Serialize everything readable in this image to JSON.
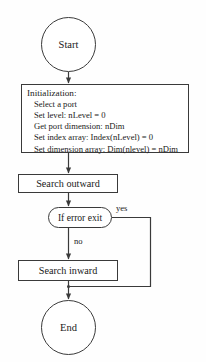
{
  "diagram": {
    "stroke_color": "#3a3a3a",
    "background_color": "#ffffff"
  },
  "nodes": {
    "start": {
      "label": "Start",
      "shape": "circle"
    },
    "initialization": {
      "shape": "process",
      "title": "Initialization:",
      "steps": [
        "Select a port",
        "Set level:  nLevel = 0",
        "Get port dimension:  nDim",
        "Set index array: Index(nLevel) = 0",
        "Set dimension array: Dim(nlevel) = nDim"
      ]
    },
    "search_outward": {
      "label": "Search outward",
      "shape": "process"
    },
    "decision": {
      "label": "If error exit",
      "shape": "decision"
    },
    "search_inward": {
      "label": "Search inward",
      "shape": "process"
    },
    "end": {
      "label": "End",
      "shape": "circle"
    }
  },
  "edges": {
    "yes_label": "yes",
    "no_label": "no"
  }
}
